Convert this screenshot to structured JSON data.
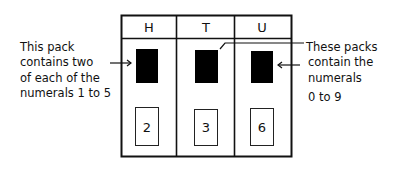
{
  "columns": [
    {
      "header": "H",
      "card_value": "2"
    },
    {
      "header": "T",
      "card_value": "3"
    },
    {
      "header": "U",
      "card_value": "6"
    }
  ],
  "left_annotation": {
    "lines": [
      "This pack",
      "contains two",
      "of each of the",
      "numerals 1 to 5"
    ]
  },
  "right_annotation": {
    "lines": [
      "These packs",
      "contain the",
      "numerals",
      "0 to 9"
    ]
  },
  "colors": {
    "ink": "#111111",
    "pack": "#000000",
    "background": "#ffffff"
  }
}
